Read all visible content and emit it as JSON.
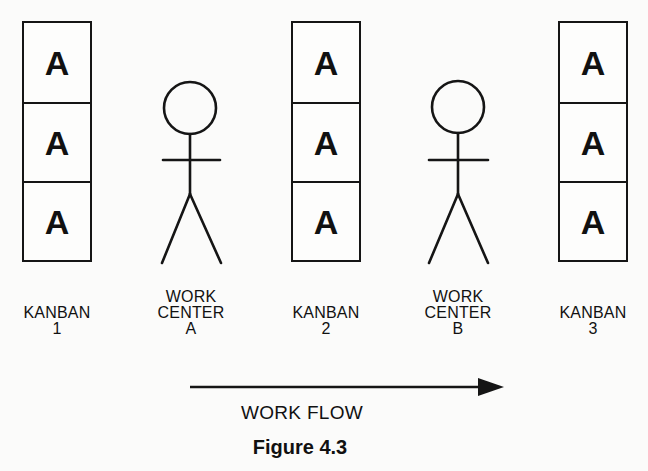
{
  "diagram": {
    "kanbans": [
      {
        "label_line1": "KANBAN",
        "label_line2": "1",
        "cards": [
          "A",
          "A",
          "A"
        ]
      },
      {
        "label_line1": "KANBAN",
        "label_line2": "2",
        "cards": [
          "A",
          "A",
          "A"
        ]
      },
      {
        "label_line1": "KANBAN",
        "label_line2": "3",
        "cards": [
          "A",
          "A",
          "A"
        ]
      }
    ],
    "work_centers": [
      {
        "label_line1": "WORK",
        "label_line2": "CENTER",
        "label_line3": "A"
      },
      {
        "label_line1": "WORK",
        "label_line2": "CENTER",
        "label_line3": "B"
      }
    ],
    "flow_label": "WORK FLOW",
    "caption": "Figure 4.3"
  }
}
